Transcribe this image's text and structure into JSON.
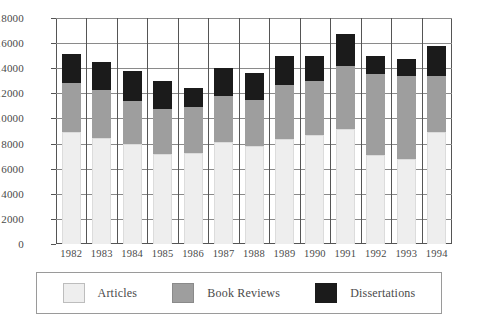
{
  "chart_data": {
    "type": "bar",
    "subtype": "stacked-vertical",
    "title": "",
    "xlabel": "",
    "ylabel": "",
    "ylim": [
      0,
      18000
    ],
    "ytick_step": 2000,
    "yticks": [
      0,
      2000,
      4000,
      6000,
      8000,
      10000,
      12000,
      14000,
      16000,
      18000
    ],
    "ytick_labels": [
      "0",
      "2000",
      "4000",
      "6000",
      "8000",
      "10000",
      "12000",
      "14000",
      "16000",
      "18000"
    ],
    "grid": true,
    "grid_axes": "both",
    "legend_position": "bottom",
    "categories": [
      "1982",
      "1983",
      "1984",
      "1985",
      "1986",
      "1987",
      "1988",
      "1989",
      "1990",
      "1991",
      "1992",
      "1993",
      "1994"
    ],
    "series": [
      {
        "name": "Articles",
        "color": "#eeeeee",
        "values": [
          8900,
          8450,
          8000,
          7150,
          7250,
          8100,
          7800,
          8350,
          8700,
          9200,
          7100,
          6750,
          8900
        ]
      },
      {
        "name": "Book Reviews",
        "color": "#9e9e9e",
        "values": [
          3900,
          3800,
          3400,
          3600,
          3700,
          3700,
          3700,
          4300,
          4250,
          5000,
          6450,
          6650,
          4500
        ]
      },
      {
        "name": "Dissertations",
        "color": "#1b1b1b",
        "values": [
          2300,
          2250,
          2350,
          2200,
          1500,
          2250,
          2100,
          2350,
          2050,
          2500,
          1450,
          1350,
          2350
        ]
      }
    ],
    "totals": [
      15100,
      14500,
      13750,
      12950,
      12450,
      14050,
      13600,
      15000,
      15000,
      16700,
      15000,
      14750,
      15750
    ]
  },
  "legend": {
    "entries": [
      {
        "label": "Articles",
        "swatch": "articles-swatch"
      },
      {
        "label": "Book Reviews",
        "swatch": "book-reviews-swatch"
      },
      {
        "label": "Dissertations",
        "swatch": "dissertations-swatch"
      }
    ]
  }
}
